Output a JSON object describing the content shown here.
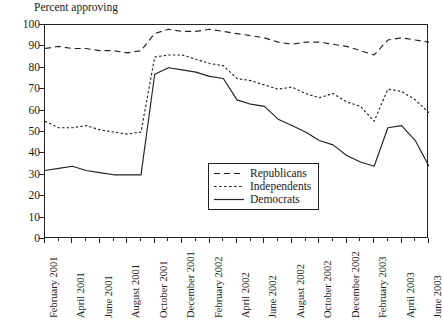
{
  "chart_data": {
    "type": "line",
    "title": "Percent approving",
    "xlabel": "",
    "ylabel": "Percent approving",
    "ylim": [
      0,
      100
    ],
    "ytick_step": 10,
    "yticks": [
      0,
      10,
      20,
      30,
      40,
      50,
      60,
      70,
      80,
      90,
      100
    ],
    "grid": false,
    "legend_position": "center-bottom-right",
    "x": [
      "February 2001",
      "March 2001",
      "April 2001",
      "May 2001",
      "June 2001",
      "July 2001",
      "August 2001",
      "September 2001",
      "October 2001",
      "November 2001",
      "December 2001",
      "January 2002",
      "February 2002",
      "March 2002",
      "April 2002",
      "May 2002",
      "June 2002",
      "July 2002",
      "August 2002",
      "September 2002",
      "October 2002",
      "November 2002",
      "December 2002",
      "January 2003",
      "February 2003",
      "March 2003",
      "April 2003",
      "May 2003",
      "June 2003"
    ],
    "xtick_labels": [
      "February 2001",
      "April 2001",
      "June 2001",
      "August 2001",
      "October 2001",
      "December 2001",
      "February 2002",
      "April 2002",
      "June 2002",
      "August 2002",
      "October 2002",
      "December 2002",
      "February 2003",
      "April 2003",
      "June 2003"
    ],
    "categories": [
      "February 2001",
      "March 2001",
      "April 2001",
      "May 2001",
      "June 2001",
      "July 2001",
      "August 2001",
      "September 2001",
      "October 2001",
      "November 2001",
      "December 2001",
      "January 2002",
      "February 2002",
      "March 2002",
      "April 2002",
      "May 2002",
      "June 2002",
      "July 2002",
      "August 2002",
      "September 2002",
      "October 2002",
      "November 2002",
      "December 2002",
      "January 2003",
      "February 2003",
      "March 2003",
      "April 2003",
      "May 2003",
      "June 2003"
    ],
    "series": [
      {
        "name": "Republicans",
        "style": "dashed",
        "values": [
          89,
          90,
          89,
          89,
          88,
          88,
          87,
          88,
          96,
          98,
          97,
          97,
          98,
          97,
          96,
          95,
          94,
          92,
          91,
          92,
          92,
          91,
          90,
          88,
          86,
          93,
          94,
          93,
          92
        ]
      },
      {
        "name": "Independents",
        "style": "dotted",
        "values": [
          55,
          52,
          52,
          53,
          51,
          50,
          49,
          50,
          85,
          86,
          86,
          84,
          82,
          81,
          75,
          74,
          72,
          70,
          71,
          68,
          66,
          68,
          64,
          62,
          55,
          70,
          69,
          65,
          59
        ]
      },
      {
        "name": "Democrats",
        "style": "solid",
        "values": [
          32,
          33,
          34,
          32,
          31,
          30,
          30,
          30,
          77,
          80,
          79,
          78,
          76,
          75,
          65,
          63,
          62,
          56,
          53,
          50,
          46,
          44,
          39,
          36,
          34,
          52,
          53,
          46,
          34
        ]
      }
    ]
  },
  "legend": {
    "items": [
      {
        "label": "Republicans",
        "style": "dashed"
      },
      {
        "label": "Independents",
        "style": "dotted"
      },
      {
        "label": "Democrats",
        "style": "solid"
      }
    ]
  }
}
